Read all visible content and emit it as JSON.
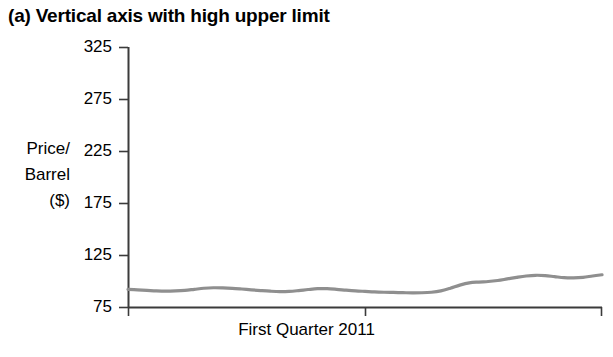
{
  "title": "(a) Vertical axis with high upper limit",
  "axis_label": {
    "line1": "Price/",
    "line2": "Barrel",
    "line3": "($)"
  },
  "xlabel": "First Quarter 2011",
  "ytick_labels": [
    "325",
    "275",
    "225",
    "175",
    "125",
    "75"
  ],
  "colors": {
    "background": "#ffffff",
    "text": "#000000",
    "axis": "#3b3b3b",
    "series": "#8f8f8f"
  },
  "chart_data": {
    "type": "line",
    "title": "(a) Vertical axis with high upper limit",
    "xlabel": "First Quarter 2011",
    "ylabel": "Price/Barrel ($)",
    "ylim": [
      75,
      325
    ],
    "yticks": [
      75,
      125,
      175,
      225,
      275,
      325
    ],
    "xticks_labeled": false,
    "grid": false,
    "legend": false,
    "series": [
      {
        "name": "Price per barrel",
        "x": [
          0,
          2,
          4,
          6,
          8,
          10,
          12,
          14,
          16,
          18,
          20,
          22,
          24,
          26,
          28,
          30,
          32,
          34,
          36,
          38,
          40,
          42,
          44,
          46,
          48,
          50,
          52,
          54,
          56,
          58,
          60,
          62,
          64,
          66,
          68,
          70,
          72,
          74,
          76,
          78,
          80,
          82,
          84,
          86,
          88,
          90,
          92,
          94,
          96,
          98,
          100
        ],
        "values": [
          92,
          91.5,
          91,
          90.5,
          90.3,
          90.5,
          91,
          92,
          93,
          93.5,
          93.4,
          93,
          92.3,
          91.5,
          90.8,
          90.2,
          89.8,
          90,
          90.8,
          91.8,
          92.6,
          92.6,
          92,
          91.2,
          90.5,
          90,
          89.5,
          89.2,
          89,
          88.8,
          88.6,
          88.7,
          89.2,
          90.5,
          93,
          96,
          98.2,
          99,
          99.5,
          100.5,
          102,
          103.5,
          104.8,
          105.5,
          105.2,
          104.2,
          103.2,
          103,
          103.5,
          104.8,
          106
        ]
      }
    ]
  },
  "geometry": {
    "plot_left": 128,
    "plot_right": 602,
    "plot_top": 47,
    "plot_bottom": 307,
    "y_min": 75,
    "y_max": 325
  }
}
